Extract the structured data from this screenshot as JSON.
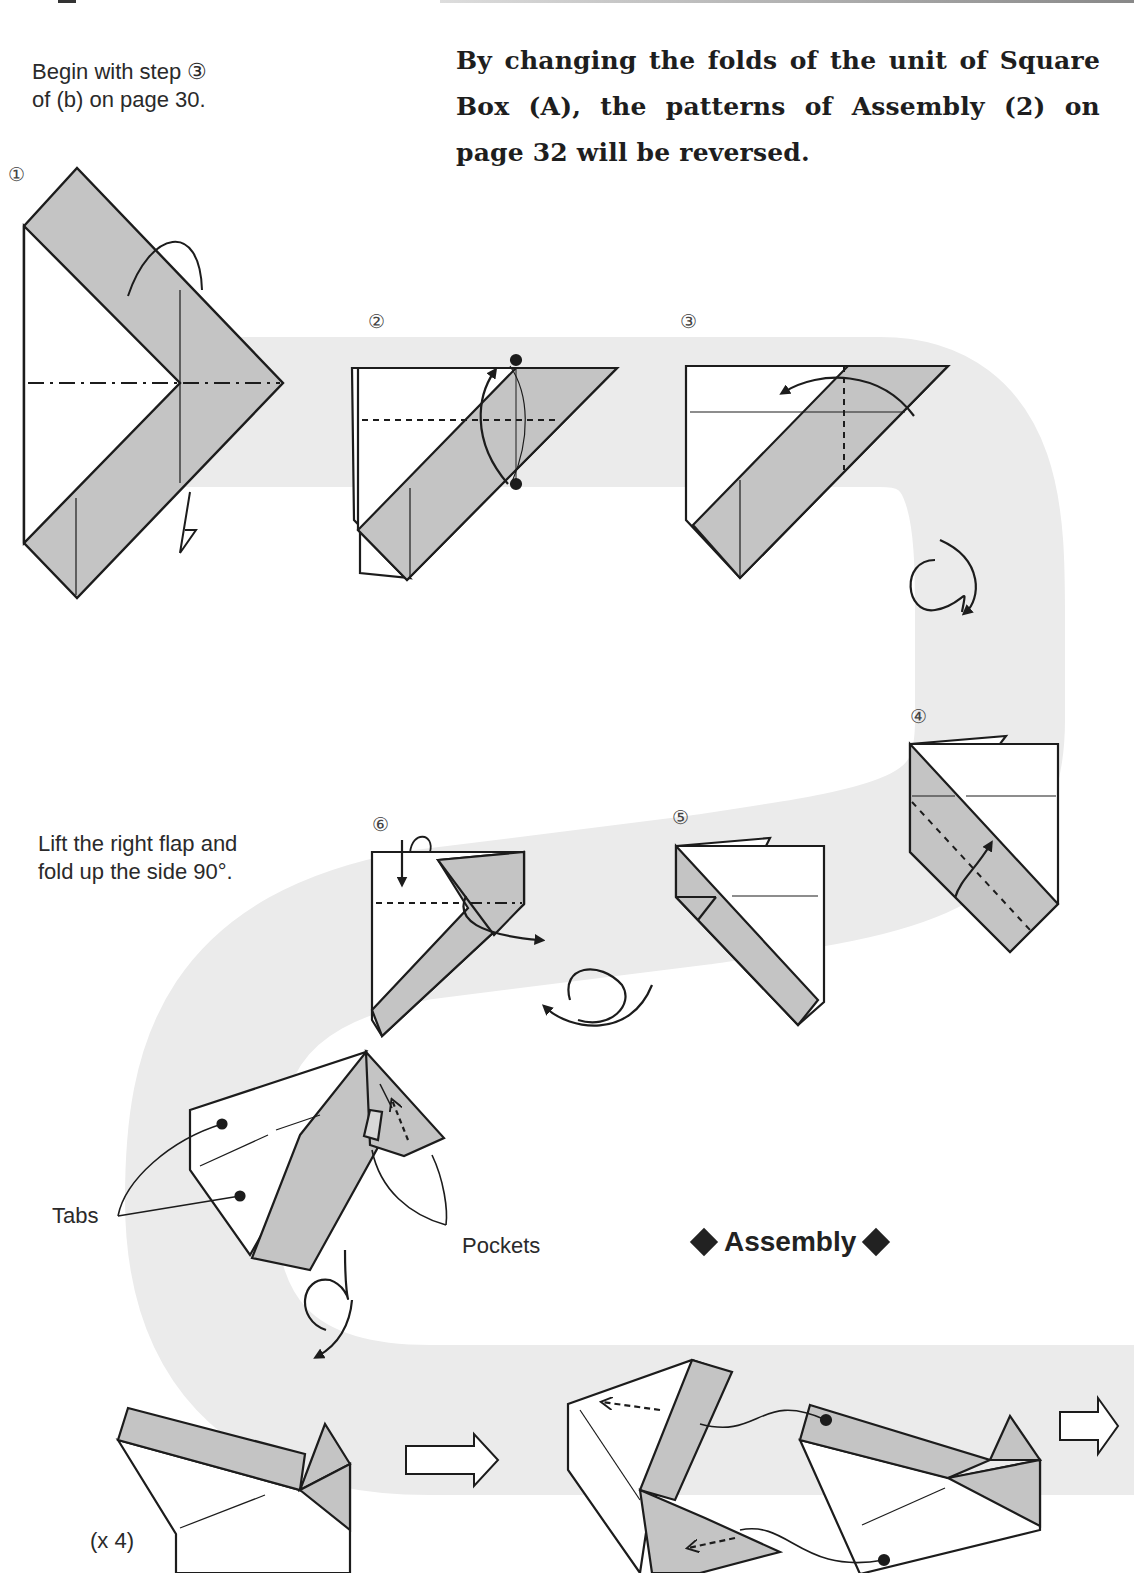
{
  "intro": {
    "line1": "Begin with step ③",
    "line2": "of (b) on page 30."
  },
  "headline": "By changing the folds of the unit of Square Box (A), the patterns of Assembly (2) on page 32 will be reversed.",
  "steps": [
    {
      "number": "①"
    },
    {
      "number": "②"
    },
    {
      "number": "③"
    },
    {
      "number": "④"
    },
    {
      "number": "⑤"
    },
    {
      "number": "⑥"
    }
  ],
  "step6_note": {
    "line1": "Lift the right flap and",
    "line2": "fold up the side 90°."
  },
  "labels": {
    "tabs": "Tabs",
    "pockets": "Pockets",
    "multiplier": "(x 4)"
  },
  "assembly_heading": "Assembly",
  "colors": {
    "paper_gray": "#c4c4c4",
    "path_band": "#ebebeb",
    "line": "#1c1c1c"
  }
}
